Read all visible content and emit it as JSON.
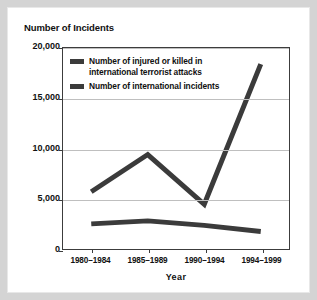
{
  "figure": {
    "background_color": "#d4d4d4",
    "card_color": "#ffffff",
    "line_color": "#3b3b3b",
    "grid_color": "#bfbfbf",
    "axis_color": "#3c3c3c"
  },
  "chart_data": {
    "type": "line",
    "title": "Number of Incidents",
    "xlabel": "Year",
    "ylabel": "",
    "categories": [
      "1980–1984",
      "1985–1989",
      "1990–1994",
      "1994–1999"
    ],
    "series": [
      {
        "name": "Number of injured or killed in international terrorist attacks",
        "values": [
          2500,
          2800,
          2350,
          1750
        ]
      },
      {
        "name": "Number of international incidents",
        "values": [
          5700,
          9400,
          4450,
          18400
        ]
      }
    ],
    "ylim": [
      0,
      20000
    ],
    "yticks": [
      0,
      5000,
      10000,
      15000,
      20000
    ],
    "ytick_labels": [
      "0",
      "5,000",
      "10,000",
      "15,000",
      "20,000"
    ],
    "grid": true,
    "grid_axis": "y",
    "legend_position": "top-left-inside"
  },
  "legend": {
    "items": [
      {
        "line1": "Number of injured or killed in",
        "line2": "international terrorist attacks"
      },
      {
        "line1": "Number of international incidents",
        "line2": ""
      }
    ]
  }
}
